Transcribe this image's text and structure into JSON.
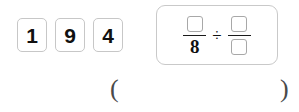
{
  "tray": {
    "name": "digit-tiles",
    "tiles": [
      {
        "label": "1"
      },
      {
        "label": "9"
      },
      {
        "label": "4"
      }
    ]
  },
  "expression": {
    "left_fraction": {
      "numerator": "",
      "denominator": "8"
    },
    "operator": "÷",
    "right_fraction": {
      "numerator": "",
      "denominator": ""
    }
  },
  "answer": {
    "open_paren": "(",
    "close_paren": ")",
    "value": "",
    "placeholder": ""
  },
  "colors": {
    "tile_border": "#c7c7c7",
    "panel_border": "#c9c9c9",
    "blank_border": "#a8a8a8",
    "text": "#111111",
    "paren": "#4a4a4a",
    "background": "#ffffff"
  }
}
